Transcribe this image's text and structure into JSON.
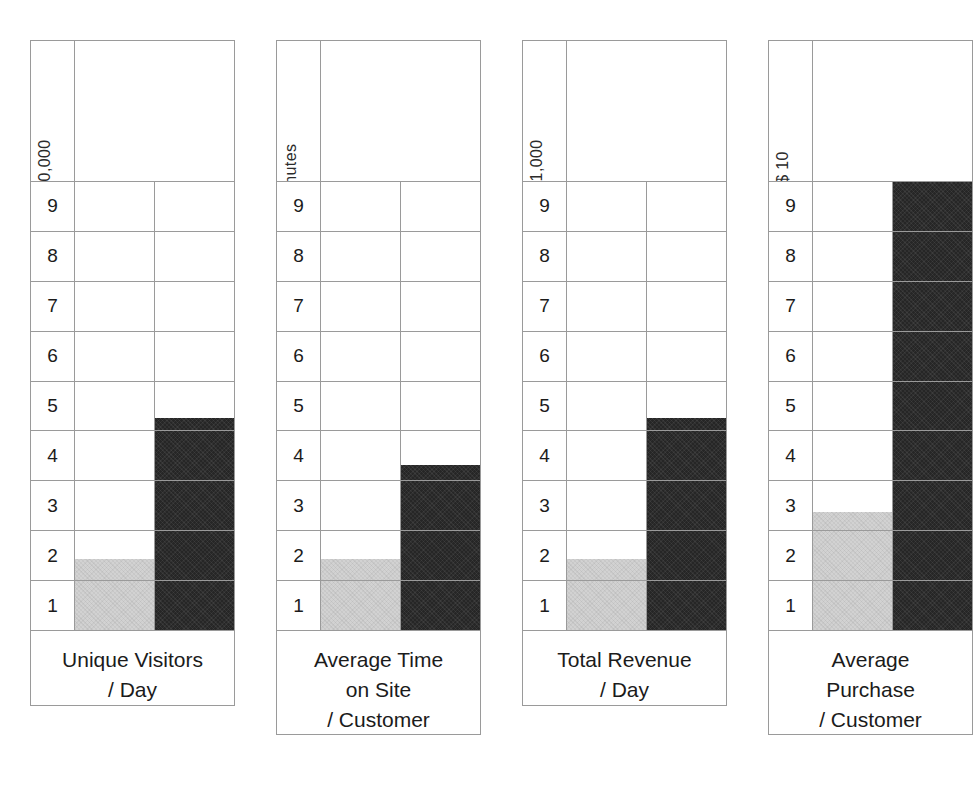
{
  "page": {
    "background_color": "#ffffff",
    "grid_line_color": "#9a9a9a",
    "series_a_color": "#d2d2d2",
    "series_b_color": "#262626"
  },
  "chart_data": [
    {
      "type": "bar",
      "title": "Unique Visitors / Day",
      "title_lines": [
        "Unique Visitors",
        "/ Day"
      ],
      "ylabel": "X 10,000",
      "xlabel": "",
      "categories": [
        "Before",
        "After"
      ],
      "series": [
        {
          "name": "Before",
          "color": "#d2d2d2",
          "values": [
            1.5
          ]
        },
        {
          "name": "After",
          "color": "#262626",
          "values": [
            4.5
          ]
        }
      ],
      "values": [
        1.5,
        4.5
      ],
      "ylim": [
        0,
        10
      ],
      "yticks": [
        9,
        8,
        7,
        6,
        5,
        4,
        3,
        2,
        1
      ],
      "grid": true,
      "legend": "none"
    },
    {
      "type": "bar",
      "title": "Average Time on Site / Customer",
      "title_lines": [
        "Average Time",
        "on Site",
        "/ Customer"
      ],
      "ylabel": "Minutes",
      "xlabel": "",
      "categories": [
        "Before",
        "After"
      ],
      "series": [
        {
          "name": "Before",
          "color": "#d2d2d2",
          "values": [
            1.5
          ]
        },
        {
          "name": "After",
          "color": "#262626",
          "values": [
            3.5
          ]
        }
      ],
      "values": [
        1.5,
        3.5
      ],
      "ylim": [
        0,
        10
      ],
      "yticks": [
        9,
        8,
        7,
        6,
        5,
        4,
        3,
        2,
        1
      ],
      "grid": true,
      "legend": "none"
    },
    {
      "type": "bar",
      "title": "Total Revenue / Day",
      "title_lines": [
        "Total Revenue",
        "/ Day"
      ],
      "ylabel": "X $1,000",
      "xlabel": "",
      "categories": [
        "Before",
        "After"
      ],
      "series": [
        {
          "name": "Before",
          "color": "#d2d2d2",
          "values": [
            1.5
          ]
        },
        {
          "name": "After",
          "color": "#262626",
          "values": [
            4.5
          ]
        }
      ],
      "values": [
        1.5,
        4.5
      ],
      "ylim": [
        0,
        10
      ],
      "yticks": [
        9,
        8,
        7,
        6,
        5,
        4,
        3,
        2,
        1
      ],
      "grid": true,
      "legend": "none"
    },
    {
      "type": "bar",
      "title": "Average Purchase / Customer",
      "title_lines": [
        "Average",
        "Purchase",
        "/ Customer"
      ],
      "ylabel": "X$ 10",
      "xlabel": "",
      "categories": [
        "Before",
        "After"
      ],
      "series": [
        {
          "name": "Before",
          "color": "#d2d2d2",
          "values": [
            2.5
          ]
        },
        {
          "name": "After",
          "color": "#262626",
          "values": [
            9.5
          ]
        }
      ],
      "values": [
        2.5,
        9.5
      ],
      "ylim": [
        0,
        10
      ],
      "yticks": [
        9,
        8,
        7,
        6,
        5,
        4,
        3,
        2,
        1
      ],
      "grid": true,
      "legend": "none"
    }
  ]
}
